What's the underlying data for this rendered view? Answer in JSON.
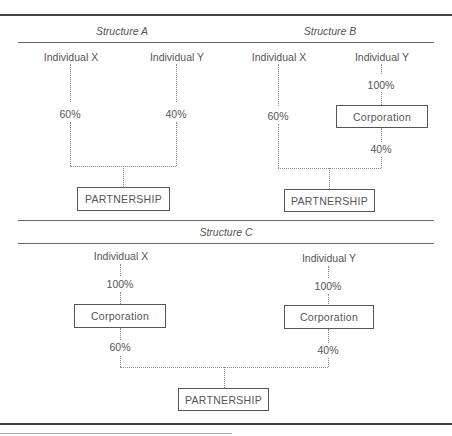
{
  "structures": [
    {
      "title": "Structure A",
      "owners": [
        {
          "name": "Individual X",
          "pct_to_partnership": "60%"
        },
        {
          "name": "Individual Y",
          "pct_to_partnership": "40%"
        }
      ],
      "entity": "PARTNERSHIP"
    },
    {
      "title": "Structure B",
      "owners": [
        {
          "name": "Individual X",
          "pct_to_partnership": "60%"
        },
        {
          "name": "Individual Y",
          "pct_to_corporation": "100%",
          "intermediate": "Corporation",
          "pct_to_partnership": "40%"
        }
      ],
      "entity": "PARTNERSHIP"
    },
    {
      "title": "Structure C",
      "owners": [
        {
          "name": "Individual X",
          "pct_to_corporation": "100%",
          "intermediate": "Corporation",
          "pct_to_partnership": "60%"
        },
        {
          "name": "Individual Y",
          "pct_to_corporation": "100%",
          "intermediate": "Corporation",
          "pct_to_partnership": "40%"
        }
      ],
      "entity": "PARTNERSHIP"
    }
  ]
}
